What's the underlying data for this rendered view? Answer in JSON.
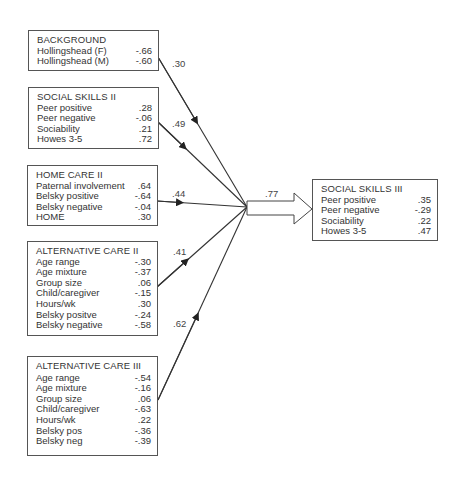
{
  "diagram": {
    "boxes": {
      "background": {
        "title": "BACKGROUND",
        "rows": [
          {
            "label": "Hollingshead (F)",
            "value": "-.66"
          },
          {
            "label": "Hollingshead (M)",
            "value": "-.60"
          }
        ]
      },
      "social_skills_ii": {
        "title": "SOCIAL SKILLS  II",
        "rows": [
          {
            "label": "Peer positive",
            "value": ".28"
          },
          {
            "label": "Peer negative",
            "value": "-.06"
          },
          {
            "label": "Sociability",
            "value": ".21"
          },
          {
            "label": "Howes 3-5",
            "value": ".72"
          }
        ]
      },
      "home_care_ii": {
        "title": "HOME CARE  II",
        "rows": [
          {
            "label": "Paternal involvement",
            "value": ".64"
          },
          {
            "label": "Belsky positive",
            "value": "-.64"
          },
          {
            "label": "Belsky negative",
            "value": "-.04"
          },
          {
            "label": "HOME",
            "value": ".30"
          }
        ]
      },
      "alternative_care_ii": {
        "title": "ALTERNATIVE CARE  II",
        "rows": [
          {
            "label": "Age range",
            "value": "-.30"
          },
          {
            "label": "Age mixture",
            "value": "-.37"
          },
          {
            "label": "Group size",
            "value": ".06"
          },
          {
            "label": "Child/caregiver",
            "value": "-.15"
          },
          {
            "label": "Hours/wk",
            "value": ".30"
          },
          {
            "label": "Belsky positve",
            "value": "-.24"
          },
          {
            "label": "Belsky negative",
            "value": "-.58"
          }
        ]
      },
      "alternative_care_iii": {
        "title": "ALTERNATIVE CARE  III",
        "rows": [
          {
            "label": "Age range",
            "value": "-.54"
          },
          {
            "label": "Age mixture",
            "value": "-.16"
          },
          {
            "label": "Group size",
            "value": ".06"
          },
          {
            "label": "Child/caregiver",
            "value": "-.63"
          },
          {
            "label": "Hours/wk",
            "value": ".22"
          },
          {
            "label": "Belsky pos",
            "value": "-.36"
          },
          {
            "label": "Belsky neg",
            "value": "-.39"
          }
        ]
      },
      "social_skills_iii": {
        "title": "SOCIAL SKILLS III",
        "rows": [
          {
            "label": "Peer positive",
            "value": ".35"
          },
          {
            "label": "Peer negative",
            "value": "-.29"
          },
          {
            "label": "Sociability",
            "value": ".22"
          },
          {
            "label": "Howes 3-5",
            "value": ".47"
          }
        ]
      }
    },
    "paths": {
      "background": ".30",
      "social_skills_ii": ".49",
      "home_care_ii": ".44",
      "alternative_care_ii": ".41",
      "alternative_care_iii": ".62",
      "combined": ".77"
    },
    "colors": {
      "line": "#333333",
      "box_border": "#555555",
      "text": "#333333"
    }
  }
}
